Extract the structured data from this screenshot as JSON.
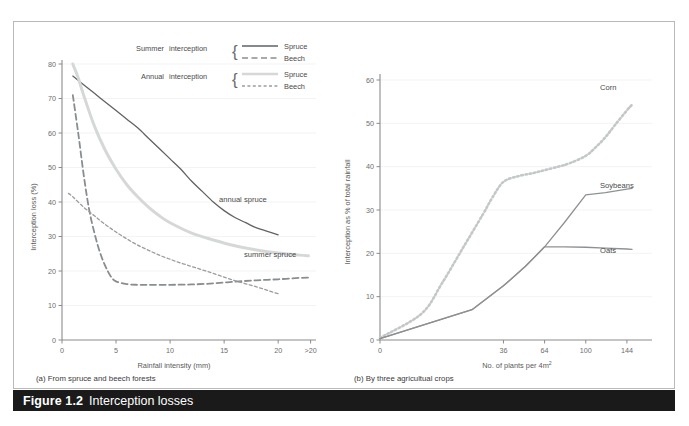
{
  "figure": {
    "number": "Figure 1.2",
    "title": "Interception losses"
  },
  "legend": {
    "rows": [
      {
        "group": "Summer",
        "word": "interception",
        "items": [
          {
            "label": "Spruce",
            "style": "solid",
            "color": "#5f6366"
          },
          {
            "label": "Beech",
            "style": "long-dash",
            "color": "#8a8d90"
          }
        ]
      },
      {
        "group": "Annual",
        "word": "interception",
        "items": [
          {
            "label": "Spruce",
            "style": "solid-thick-light",
            "color": "#d6d8d8"
          },
          {
            "label": "Beech",
            "style": "short-dash",
            "color": "#9a9d9f"
          }
        ]
      }
    ]
  },
  "panel_a": {
    "subcaption": "(a) From spruce and beech forests",
    "annotations": [
      {
        "text": "annual spruce"
      },
      {
        "text": "summer spruce"
      }
    ]
  },
  "panel_b": {
    "subcaption": "(b) By three agricultual crops",
    "annotations": [
      {
        "text": "Corn"
      },
      {
        "text": "Soybeans"
      },
      {
        "text": "Oats"
      }
    ]
  },
  "chart_data": [
    {
      "type": "line",
      "panel": "a",
      "title": "(a) From spruce and beech forests",
      "xlabel": "Rainfall intensity (mm)",
      "ylabel": "Interception loss (%)",
      "xlim": [
        0,
        23.5
      ],
      "ylim": [
        0,
        80
      ],
      "xticks": [
        0,
        5,
        10,
        15,
        20,
        23
      ],
      "xticklabels": [
        "0",
        "5",
        "10",
        "15",
        "20",
        ">20"
      ],
      "yticks": [
        0,
        10,
        20,
        30,
        40,
        50,
        60,
        70,
        80
      ],
      "grid": "horizontal-faint",
      "legend_position": "top-center",
      "series": [
        {
          "name": "annual spruce",
          "label_in_legend": "Summer interception Spruce",
          "style": "solid",
          "color": "#5f6366",
          "x": [
            1.0,
            2.0,
            3.0,
            4.0,
            5.0,
            6.0,
            7.0,
            8.0,
            9.0,
            10.0,
            11.0,
            12.0,
            13.0,
            14.0,
            15.0,
            16.0,
            17.0,
            18.0,
            19.0,
            20.0
          ],
          "y": [
            76.5,
            74.0,
            71.5,
            69.0,
            66.5,
            64.0,
            61.5,
            58.5,
            55.5,
            52.5,
            49.5,
            46.0,
            43.0,
            40.0,
            37.5,
            35.5,
            34.0,
            32.5,
            31.5,
            30.5
          ]
        },
        {
          "name": "summer spruce",
          "label_in_legend": "Annual interception Spruce",
          "style": "solid-thick-light",
          "color": "#d6d8d8",
          "x": [
            1.0,
            1.5,
            2.0,
            3.0,
            4.0,
            5.0,
            6.0,
            7.0,
            8.0,
            9.0,
            10.0,
            12.0,
            14.0,
            16.0,
            18.0,
            20.0,
            22.0,
            22.8
          ],
          "y": [
            80.0,
            76.0,
            71.0,
            62.0,
            55.0,
            49.5,
            45.0,
            41.5,
            38.5,
            36.0,
            34.0,
            31.0,
            29.0,
            27.3,
            26.1,
            25.2,
            24.6,
            24.4
          ]
        },
        {
          "name": "summer beech",
          "label_in_legend": "Summer interception Beech",
          "style": "long-dash",
          "color": "#8a8d90",
          "x": [
            1.0,
            1.5,
            2.0,
            2.5,
            3.0,
            3.5,
            4.0,
            4.5,
            5.0,
            6.0,
            7.0,
            8.0,
            10.0,
            12.0,
            14.0,
            16.0,
            18.0,
            20.0,
            22.0,
            22.8
          ],
          "y": [
            71.0,
            60.0,
            48.0,
            38.0,
            31.0,
            25.5,
            21.5,
            18.5,
            17.0,
            16.2,
            16.0,
            16.0,
            16.0,
            16.1,
            16.4,
            16.9,
            17.3,
            17.6,
            18.0,
            18.1
          ]
        },
        {
          "name": "annual beech",
          "label_in_legend": "Annual interception Beech",
          "style": "short-dash",
          "color": "#9a9d9f",
          "x": [
            0.6,
            1.0,
            2.0,
            3.0,
            4.0,
            5.0,
            6.0,
            7.0,
            8.0,
            9.0,
            10.0,
            11.0,
            12.0,
            13.0,
            14.0,
            15.0,
            16.0,
            17.0,
            18.0,
            19.0,
            20.0
          ],
          "y": [
            42.5,
            41.5,
            38.5,
            36.0,
            33.5,
            31.3,
            29.3,
            27.5,
            26.0,
            24.6,
            23.4,
            22.3,
            21.3,
            20.3,
            19.3,
            18.2,
            17.2,
            16.3,
            15.4,
            14.4,
            13.4
          ]
        }
      ]
    },
    {
      "type": "line",
      "panel": "b",
      "title": "(b) By three agricultual crops",
      "xlabel": "No. of plants per 4m2",
      "ylabel": "Interception as % of total rainfall",
      "xlim": [
        0,
        150
      ],
      "ylim": [
        0,
        60
      ],
      "xticks": [
        0,
        36,
        64,
        100,
        144
      ],
      "xticklabels": [
        "0",
        "36",
        "64",
        "100",
        "144"
      ],
      "yticks": [
        0,
        10,
        20,
        30,
        40,
        50,
        60
      ],
      "grid": "horizontal-faint",
      "legend_position": "inline-right-labels",
      "series": [
        {
          "name": "Corn",
          "style": "dotted",
          "color": "#c4c7c8",
          "x": [
            0,
            4,
            9,
            16,
            25,
            30,
            36,
            45,
            55,
            64,
            75,
            85,
            100,
            110,
            120,
            130,
            144,
            150
          ],
          "y": [
            0.5,
            6.0,
            13.0,
            21.0,
            29.0,
            33.0,
            36.5,
            37.8,
            38.5,
            39.2,
            40.0,
            40.8,
            42.5,
            44.5,
            46.8,
            49.5,
            53.0,
            54.3
          ]
        },
        {
          "name": "Soybeans",
          "style": "solid",
          "color": "#8e9193",
          "x": [
            0,
            20,
            36,
            50,
            64,
            80,
            100,
            120,
            144,
            150
          ],
          "y": [
            0.3,
            7.0,
            12.5,
            17.0,
            21.5,
            27.0,
            33.5,
            34.0,
            34.8,
            35.0
          ]
        },
        {
          "name": "Oats",
          "style": "solid",
          "color": "#8e9193",
          "x": [
            0,
            20,
            36,
            50,
            64,
            80,
            100,
            120,
            144,
            150
          ],
          "y": [
            0.3,
            7.0,
            12.5,
            17.0,
            21.5,
            21.5,
            21.4,
            21.2,
            21.0,
            20.9
          ]
        }
      ]
    }
  ]
}
